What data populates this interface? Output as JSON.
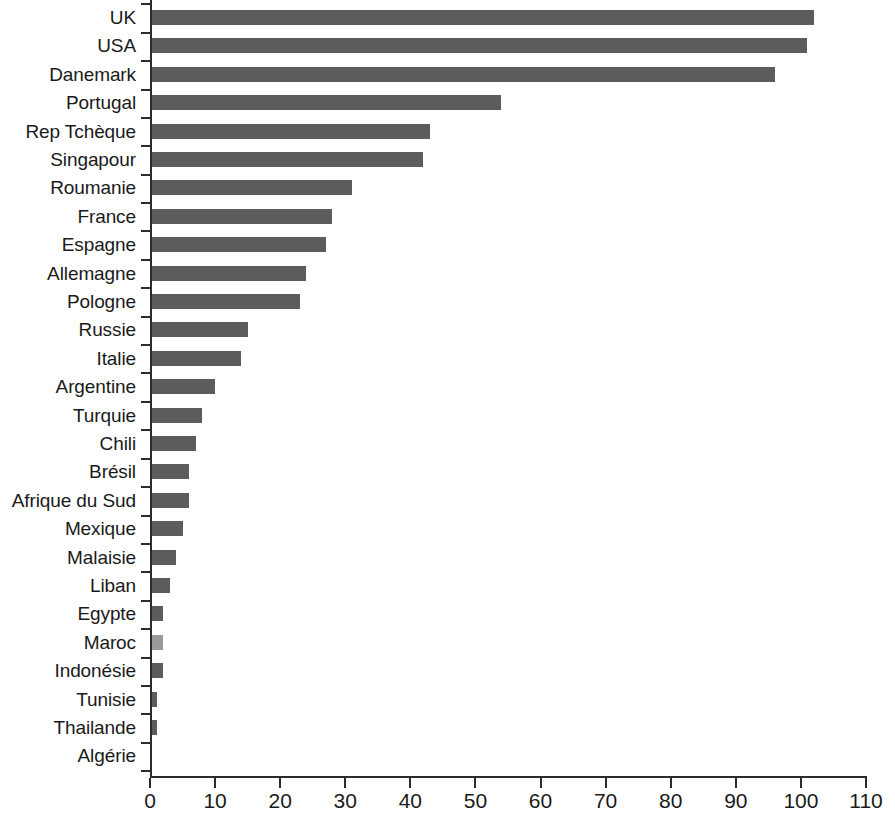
{
  "chart_data": {
    "type": "bar",
    "orientation": "horizontal",
    "title": "",
    "subtitle": "",
    "xlabel": "",
    "ylabel": "",
    "xlim": [
      0,
      110
    ],
    "xticks": [
      0,
      10,
      20,
      30,
      40,
      50,
      60,
      70,
      80,
      90,
      100,
      110
    ],
    "grid": false,
    "legend": null,
    "bar_color": "#5c5c5c",
    "highlight_color": "#9a9a9a",
    "categories": [
      "UK",
      "USA",
      "Danemark",
      "Portugal",
      "Rep Tchèque",
      "Singapour",
      "Roumanie",
      "France",
      "Espagne",
      "Allemagne",
      "Pologne",
      "Russie",
      "Italie",
      "Argentine",
      "Turquie",
      "Chili",
      "Brésil",
      "Afrique du Sud",
      "Mexique",
      "Malaisie",
      "Liban",
      "Egypte",
      "Maroc",
      "Indonésie",
      "Tunisie",
      "Thailande",
      "Algérie"
    ],
    "values": [
      102,
      101,
      96,
      54,
      43,
      42,
      31,
      28,
      27,
      24,
      23,
      15,
      14,
      10,
      8,
      7,
      6,
      6,
      5,
      4,
      3,
      2,
      2,
      2,
      1,
      1,
      0.2
    ]
  }
}
